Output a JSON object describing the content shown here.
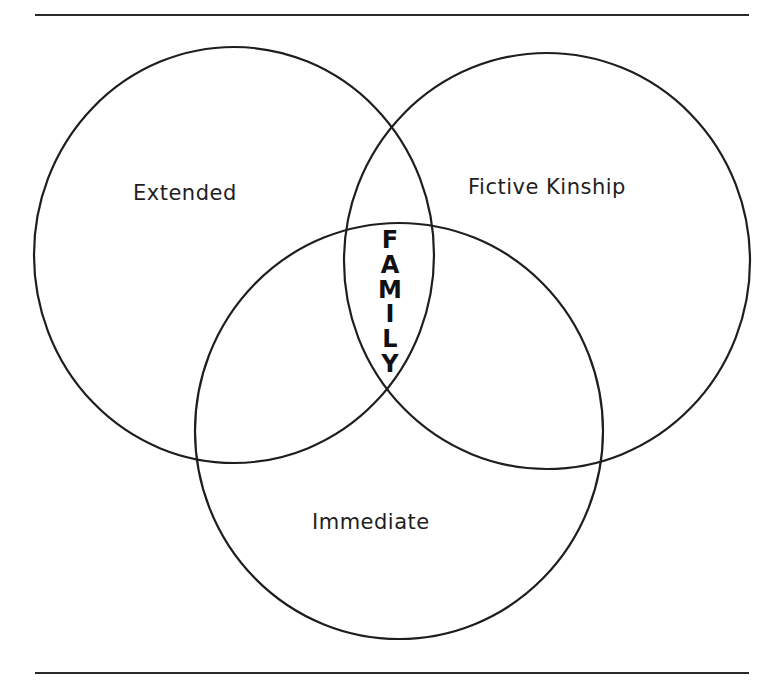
{
  "diagram": {
    "type": "venn",
    "colors": {
      "stroke": "#1e1e1e",
      "background": "#ffffff"
    },
    "circles": [
      {
        "id": "extended",
        "label": "Extended",
        "cx": 234,
        "cy": 255,
        "rx": 200,
        "ry": 208
      },
      {
        "id": "fictive-kinship",
        "label": "Fictive Kinship",
        "cx": 547,
        "cy": 261,
        "rx": 203,
        "ry": 208
      },
      {
        "id": "immediate",
        "label": "Immediate",
        "cx": 399,
        "cy": 431,
        "rx": 204,
        "ry": 208
      }
    ],
    "center_label": {
      "text": "FAMILY",
      "letters": [
        "F",
        "A",
        "M",
        "I",
        "L",
        "Y"
      ]
    }
  }
}
